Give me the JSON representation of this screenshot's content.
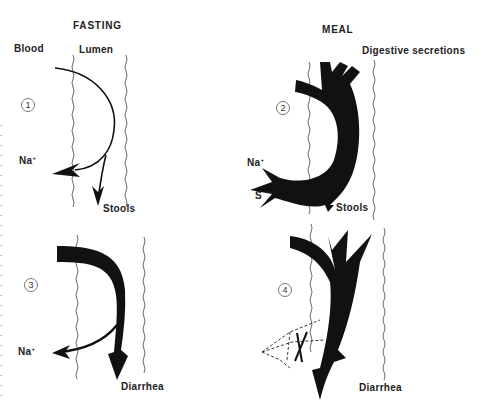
{
  "headers": {
    "fasting": "FASTING",
    "meal": "MEAL"
  },
  "labels": {
    "blood": "Blood",
    "lumen": "Lumen",
    "digestive_secretions": "Digestive secretions",
    "na": "Na",
    "na_sup": "+",
    "s": "S",
    "stools": "Stools",
    "diarrhea": "Diarrhea"
  },
  "panels": [
    {
      "number": "1",
      "condition": "Fasting",
      "outputs": [
        "Na+",
        "Stools"
      ]
    },
    {
      "number": "2",
      "condition": "Meal",
      "inputs": [
        "Digestive secretions"
      ],
      "outputs": [
        "Na+",
        "S",
        "Stools"
      ]
    },
    {
      "number": "3",
      "condition": "Fasting",
      "outputs": [
        "Na+",
        "Diarrhea"
      ]
    },
    {
      "number": "4",
      "condition": "Meal",
      "outputs": [
        "Diarrhea"
      ],
      "blocked": "Na+ / S absorption (dashed, crossed out)"
    }
  ],
  "colors": {
    "ink": "#111111",
    "membrane": "#444444",
    "background": "#ffffff"
  }
}
